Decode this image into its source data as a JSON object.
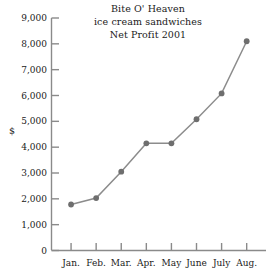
{
  "chart_data": {
    "type": "line",
    "title": "Bite O' Heaven ice cream sandwiches Net Profit 2001",
    "title_lines": [
      "Bite O' Heaven",
      "ice cream sandwiches",
      "Net Profit 2001"
    ],
    "categories": [
      "Jan.",
      "Feb.",
      "Mar.",
      "Apr.",
      "May",
      "June",
      "July",
      "Aug."
    ],
    "values": [
      1780,
      2030,
      3050,
      4150,
      4150,
      5080,
      6080,
      8100
    ],
    "xlabel": "",
    "ylabel": "$",
    "ylim": [
      0,
      9000
    ],
    "yticks": [
      0,
      1000,
      2000,
      3000,
      4000,
      5000,
      6000,
      7000,
      8000,
      9000
    ],
    "ytick_labels": [
      "0",
      "1,000",
      "2,000",
      "3,000",
      "4,000",
      "5,000",
      "6,000",
      "7,000",
      "8,000",
      "9,000"
    ],
    "grid": false,
    "legend": "none",
    "series": [
      {
        "name": "Net Profit 2001",
        "values": [
          1780,
          2030,
          3050,
          4150,
          4150,
          5080,
          6080,
          8100
        ]
      }
    ],
    "line_color": "#8c8c8c",
    "marker_color": "#6e6e6e",
    "axis_color": "#8a8a8a",
    "text_color": "#1a1a1a",
    "background": "#ffffff"
  }
}
